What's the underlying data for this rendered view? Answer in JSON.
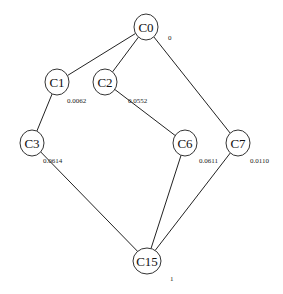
{
  "diagram": {
    "type": "lattice",
    "nodes": [
      {
        "id": "C0",
        "label": "C0",
        "x": 146,
        "y": 27,
        "rx": 12,
        "ry": 13,
        "value": "0",
        "value_x": 168,
        "value_y": 40
      },
      {
        "id": "C1",
        "label": "C1",
        "x": 57,
        "y": 82,
        "rx": 12,
        "ry": 13,
        "value": "0.0062",
        "value_x": 67,
        "value_y": 103
      },
      {
        "id": "C2",
        "label": "C2",
        "x": 105,
        "y": 82,
        "rx": 12,
        "ry": 13,
        "value": "0.0552",
        "value_x": 128,
        "value_y": 103
      },
      {
        "id": "C3",
        "label": "C3",
        "x": 32,
        "y": 143,
        "rx": 12,
        "ry": 13,
        "value": "0.0614",
        "value_x": 43,
        "value_y": 163
      },
      {
        "id": "C6",
        "label": "C6",
        "x": 185,
        "y": 143,
        "rx": 12,
        "ry": 13,
        "value": "0.0611",
        "value_x": 199,
        "value_y": 163
      },
      {
        "id": "C7",
        "label": "C7",
        "x": 238,
        "y": 143,
        "rx": 12,
        "ry": 13,
        "value": "0.0110",
        "value_x": 250,
        "value_y": 163
      },
      {
        "id": "C15",
        "label": "C15",
        "x": 147,
        "y": 261,
        "rx": 14,
        "ry": 13,
        "value": "1",
        "value_x": 170,
        "value_y": 281
      }
    ],
    "edges": [
      {
        "from": "C0",
        "to": "C1"
      },
      {
        "from": "C0",
        "to": "C2"
      },
      {
        "from": "C0",
        "to": "C7"
      },
      {
        "from": "C1",
        "to": "C3"
      },
      {
        "from": "C2",
        "to": "C6"
      },
      {
        "from": "C3",
        "to": "C15"
      },
      {
        "from": "C6",
        "to": "C15"
      },
      {
        "from": "C7",
        "to": "C15"
      }
    ]
  }
}
